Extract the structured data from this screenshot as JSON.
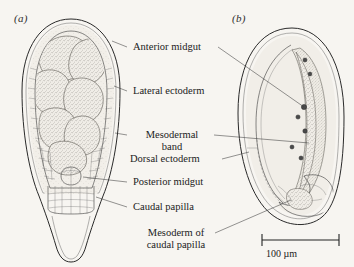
{
  "figure": {
    "background_color": "#f7f5f1",
    "ink_color": "#2b2b2b",
    "panels": [
      {
        "id": "a",
        "label": "(a)",
        "view": "dorsal-view-embryo"
      },
      {
        "id": "b",
        "label": "(b)",
        "view": "lateral-view-embryo"
      }
    ]
  },
  "annotations": [
    {
      "key": "anterior_midgut",
      "text": "Anterior midgut",
      "lines": [
        "Anterior midgut"
      ]
    },
    {
      "key": "lateral_ectoderm",
      "text": "Lateral ectoderm",
      "lines": [
        "Lateral ectoderm"
      ]
    },
    {
      "key": "mesodermal_band",
      "text": "Mesodermal band",
      "lines": [
        "Mesodermal",
        "band"
      ]
    },
    {
      "key": "dorsal_ectoderm",
      "text": "Dorsal ectoderm",
      "lines": [
        "Dorsal ectoderm"
      ]
    },
    {
      "key": "posterior_midgut",
      "text": "Posterior midgut",
      "lines": [
        "Posterior midgut"
      ]
    },
    {
      "key": "caudal_papilla",
      "text": "Caudal papilla",
      "lines": [
        "Caudal papilla"
      ]
    },
    {
      "key": "mesoderm_caudal",
      "text": "Mesoderm of caudal papilla",
      "lines": [
        "Mesoderm of",
        "caudal papilla"
      ]
    }
  ],
  "labels": {
    "anterior_midgut": "Anterior midgut",
    "lateral_ectoderm": "Lateral ectoderm",
    "mesodermal_band_line1": "Mesodermal",
    "mesodermal_band_line2": "band",
    "dorsal_ectoderm": "Dorsal ectoderm",
    "posterior_midgut": "Posterior midgut",
    "caudal_papilla": "Caudal papilla",
    "mesoderm_caudal_line1": "Mesoderm of",
    "mesoderm_caudal_line2": "caudal papilla"
  },
  "scale_bar": {
    "text": "100 µm",
    "value": 100,
    "unit": "µm"
  }
}
